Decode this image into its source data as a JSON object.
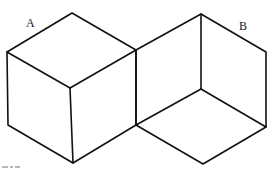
{
  "figure": {
    "type": "line-drawing",
    "stroke_color": "#111111",
    "background": "#ffffff",
    "labels": [
      {
        "id": "A",
        "text": "A",
        "x": 26,
        "y": 27
      },
      {
        "id": "B",
        "text": "B",
        "x": 239,
        "y": 30
      }
    ],
    "shapes": {
      "cube_a": {
        "label": "A",
        "outline": [
          [
            7,
            52
          ],
          [
            72,
            13
          ],
          [
            136,
            50
          ],
          [
            136,
            125
          ],
          [
            73,
            163
          ],
          [
            8,
            125
          ]
        ],
        "inner_edges": [
          [
            [
              7,
              52
            ],
            [
              70,
              88
            ]
          ],
          [
            [
              70,
              88
            ],
            [
              136,
              50
            ]
          ],
          [
            [
              70,
              88
            ],
            [
              73,
              163
            ]
          ]
        ]
      },
      "figure_b": {
        "label": "B",
        "outline": [
          [
            136,
            50
          ],
          [
            201,
            14
          ],
          [
            266,
            52
          ],
          [
            266,
            127
          ],
          [
            203,
            164
          ],
          [
            136,
            125
          ]
        ],
        "inner_edges": [
          [
            [
              201,
              14
            ],
            [
              201,
              89
            ]
          ],
          [
            [
              201,
              89
            ],
            [
              136,
              125
            ]
          ],
          [
            [
              201,
              89
            ],
            [
              266,
              127
            ]
          ]
        ]
      }
    },
    "caption_fragment_visible": true
  }
}
